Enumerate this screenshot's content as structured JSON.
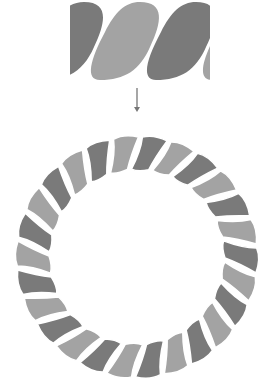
{
  "diagram": {
    "colors": {
      "background": "#ffffff",
      "strand_dark": "#7a7a7a",
      "strand_light": "#a3a3a3",
      "arrow": "#777777"
    },
    "rope_segment": {
      "x": 70,
      "y": 2,
      "width": 140,
      "height": 78,
      "strands": [
        "dark",
        "light",
        "dark"
      ]
    },
    "arrow": {
      "x": 137,
      "y1": 88,
      "y2": 112,
      "direction": "down"
    },
    "rope_ring": {
      "cx": 137,
      "cy": 257,
      "outer_radius": 120,
      "inner_radius": 88,
      "segment_count": 26
    }
  }
}
